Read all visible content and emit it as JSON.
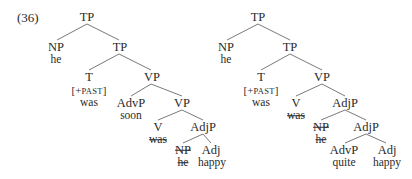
{
  "example_number": "(36)",
  "feature_open": "[+",
  "feature_name": "PAST",
  "feature_close": "]",
  "trees": [
    {
      "name": "tree-a",
      "nodes": {
        "tp_root": "TP",
        "np_subj": "NP",
        "np_subj_word": "he",
        "tp_bar": "TP",
        "t": "T",
        "t_word": "was",
        "vp": "VP",
        "advp": "AdvP",
        "advp_word": "soon",
        "vp_lower": "VP",
        "v": "V",
        "v_word_deleted": "was",
        "adjp": "AdjP",
        "np_inner_deleted": "NP",
        "np_inner_word_deleted": "he",
        "adj": "Adj",
        "adj_word": "happy"
      }
    },
    {
      "name": "tree-b",
      "nodes": {
        "tp_root": "TP",
        "np_subj": "NP",
        "np_subj_word": "he",
        "tp_bar": "TP",
        "t": "T",
        "t_word": "was",
        "vp": "VP",
        "v": "V",
        "v_word_deleted": "was",
        "adjp": "AdjP",
        "np_inner_deleted": "NP",
        "np_inner_word_deleted": "he",
        "adjp_lower": "AdjP",
        "advp": "AdvP",
        "advp_word": "quite",
        "adj": "Adj",
        "adj_word": "happy"
      }
    }
  ],
  "colors": {
    "ink": "#2a2a2a",
    "edge": "#6a6a6a",
    "background": "#ffffff"
  }
}
